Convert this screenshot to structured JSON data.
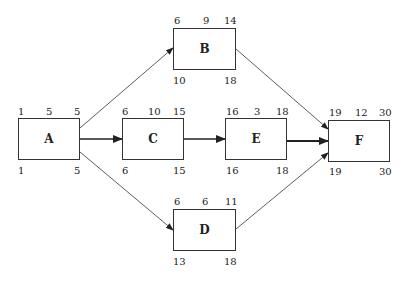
{
  "diagram": {
    "type": "activity-on-node network",
    "nodes": {
      "A": {
        "label": "A",
        "es": "1",
        "dur": "5",
        "ef": "5",
        "ls": "1",
        "lf": "5"
      },
      "B": {
        "label": "B",
        "es": "6",
        "dur": "9",
        "ef": "14",
        "ls": "10",
        "lf": "18"
      },
      "C": {
        "label": "C",
        "es": "6",
        "dur": "10",
        "ef": "15",
        "ls": "6",
        "lf": "15"
      },
      "D": {
        "label": "D",
        "es": "6",
        "dur": "6",
        "ef": "11",
        "ls": "13",
        "lf": "18"
      },
      "E": {
        "label": "E",
        "es": "16",
        "dur": "3",
        "ef": "18",
        "ls": "16",
        "lf": "18"
      },
      "F": {
        "label": "F",
        "es": "19",
        "dur": "12",
        "ef": "30",
        "ls": "19",
        "lf": "30"
      }
    },
    "edges": [
      {
        "from": "A",
        "to": "B",
        "critical": false
      },
      {
        "from": "A",
        "to": "C",
        "critical": true
      },
      {
        "from": "A",
        "to": "D",
        "critical": false
      },
      {
        "from": "C",
        "to": "E",
        "critical": true
      },
      {
        "from": "B",
        "to": "F",
        "critical": false
      },
      {
        "from": "E",
        "to": "F",
        "critical": true
      },
      {
        "from": "D",
        "to": "F",
        "critical": false
      }
    ]
  }
}
